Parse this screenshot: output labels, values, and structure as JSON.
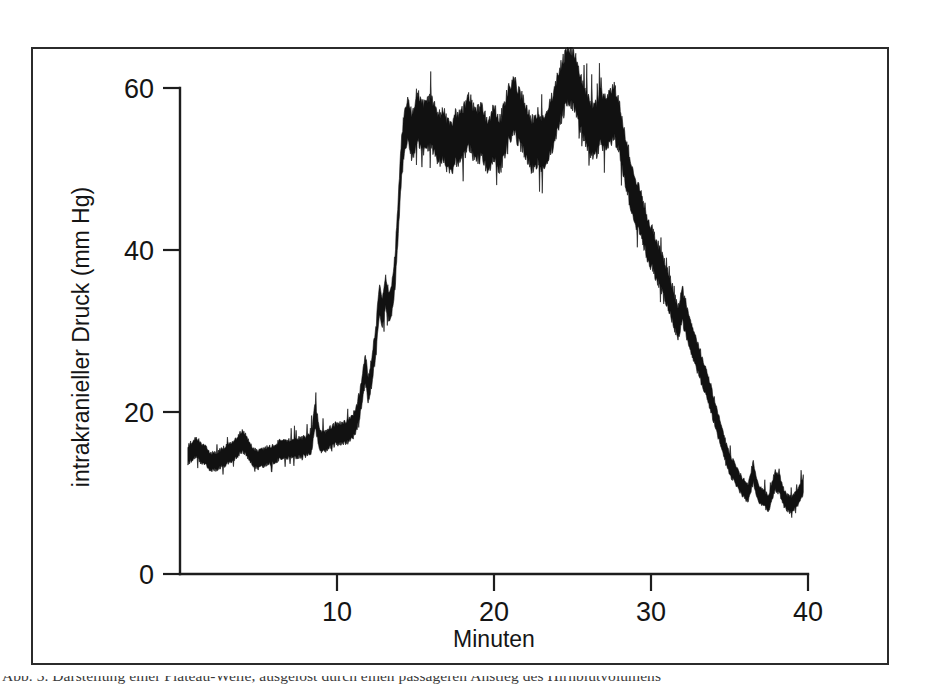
{
  "figure": {
    "background_color": "#ffffff",
    "frame_color": "#2b2b2b",
    "trace_color": "#111111",
    "caption_partial": "Abb. 3. Darstellung einer Plateau-Welle, ausgelost durch einen passageren Anstieg des Hirnblutvolumens"
  },
  "axes": {
    "x_title": "Minuten",
    "y_title": "intrakranieller Druck (mm Hg)",
    "x_ticks": [
      "10",
      "20",
      "30",
      "40"
    ],
    "y_ticks": [
      "0",
      "20",
      "40",
      "60"
    ]
  },
  "chart_data": {
    "type": "line",
    "title": "",
    "subtitle": "",
    "xlabel": "Minuten",
    "ylabel": "intrakranieller Druck (mm Hg)",
    "xlim": [
      0,
      40
    ],
    "ylim": [
      0,
      63
    ],
    "xticks": [
      10,
      20,
      30,
      40
    ],
    "yticks": [
      0,
      20,
      40,
      60
    ],
    "grid": false,
    "legend": null,
    "annotations": [],
    "series": [
      {
        "name": "intrakranieller Druck",
        "description": "Kontinuierliche ICP-Registrierung mit Plateau-Welle; dicke Spur entspricht pulsatiler Amplitude",
        "x": [
          0.5,
          1.0,
          1.5,
          2.0,
          2.5,
          3.0,
          3.5,
          4.0,
          4.3,
          4.6,
          5.0,
          5.5,
          6.0,
          6.5,
          7.0,
          7.5,
          8.0,
          8.4,
          8.6,
          8.9,
          9.3,
          9.8,
          10.3,
          10.8,
          11.2,
          11.5,
          11.8,
          12.0,
          12.2,
          12.5,
          12.7,
          12.9,
          13.1,
          13.3,
          13.5,
          13.7,
          13.9,
          14.1,
          14.3,
          14.5,
          14.8,
          15.2,
          15.6,
          16.0,
          16.4,
          16.8,
          17.2,
          17.6,
          18.0,
          18.4,
          18.8,
          19.2,
          19.6,
          20.0,
          20.4,
          20.8,
          21.2,
          21.6,
          22.0,
          22.4,
          22.8,
          23.2,
          23.6,
          24.0,
          24.4,
          24.8,
          25.2,
          25.6,
          26.0,
          26.4,
          26.8,
          27.2,
          27.6,
          28.0,
          28.3,
          28.6,
          28.9,
          29.2,
          29.5,
          29.8,
          30.1,
          30.5,
          30.9,
          31.3,
          31.7,
          32.0,
          32.3,
          32.6,
          33.0,
          33.4,
          33.8,
          34.2,
          34.6,
          35.0,
          35.4,
          35.8,
          36.2,
          36.5,
          36.8,
          37.1,
          37.5,
          37.9,
          38.2,
          38.5,
          38.9,
          39.3,
          39.7
        ],
        "y_mean": [
          14.2,
          15.0,
          14.6,
          14.0,
          14.4,
          14.8,
          15.2,
          16.4,
          15.6,
          14.8,
          14.6,
          15.0,
          14.8,
          15.2,
          15.0,
          15.4,
          15.8,
          16.4,
          19.8,
          16.2,
          16.0,
          16.6,
          17.2,
          18.0,
          19.4,
          22.0,
          26.0,
          23.0,
          25.0,
          29.0,
          34.0,
          32.0,
          35.0,
          33.0,
          34.5,
          38.0,
          45.0,
          52.0,
          55.5,
          56.5,
          54.0,
          55.5,
          53.5,
          54.5,
          53.0,
          54.0,
          52.5,
          54.0,
          53.5,
          55.0,
          53.0,
          54.5,
          53.5,
          56.0,
          54.5,
          57.0,
          58.0,
          56.0,
          54.5,
          53.0,
          54.5,
          53.5,
          55.0,
          57.0,
          58.5,
          60.0,
          59.0,
          57.5,
          56.0,
          55.0,
          56.5,
          55.0,
          56.5,
          54.5,
          52.0,
          50.0,
          47.5,
          46.5,
          44.5,
          42.0,
          40.0,
          37.5,
          35.5,
          33.5,
          31.0,
          33.5,
          31.0,
          28.5,
          26.0,
          23.5,
          21.0,
          18.5,
          16.0,
          14.0,
          12.5,
          11.0,
          10.0,
          12.5,
          10.0,
          9.5,
          9.0,
          12.0,
          11.5,
          9.5,
          8.5,
          9.0,
          10.5
        ],
        "band_halfwidth": [
          1.1,
          1.2,
          1.2,
          1.1,
          1.1,
          1.2,
          1.2,
          1.3,
          1.2,
          1.1,
          1.1,
          1.1,
          1.1,
          1.2,
          1.1,
          1.2,
          1.2,
          1.3,
          1.6,
          1.3,
          1.2,
          1.3,
          1.3,
          1.4,
          1.5,
          1.6,
          1.8,
          1.6,
          1.7,
          1.8,
          1.9,
          1.8,
          1.9,
          1.8,
          1.9,
          2.1,
          2.3,
          2.5,
          2.6,
          2.6,
          2.8,
          3.0,
          3.0,
          3.1,
          3.0,
          3.1,
          3.0,
          3.1,
          3.1,
          3.2,
          3.1,
          3.2,
          3.1,
          3.3,
          3.2,
          3.3,
          3.4,
          3.3,
          3.2,
          3.1,
          3.2,
          3.2,
          3.3,
          3.4,
          3.4,
          3.4,
          3.4,
          3.3,
          3.3,
          3.2,
          3.3,
          3.2,
          3.3,
          3.1,
          3.0,
          3.0,
          2.9,
          2.8,
          2.7,
          2.6,
          2.5,
          2.4,
          2.3,
          2.2,
          2.0,
          2.1,
          2.0,
          1.9,
          1.8,
          1.7,
          1.6,
          1.5,
          1.4,
          1.3,
          1.2,
          1.1,
          1.1,
          1.3,
          1.1,
          1.0,
          1.0,
          1.2,
          1.2,
          1.0,
          1.0,
          1.0,
          1.1
        ]
      }
    ],
    "summary": {
      "baseline_level": 15,
      "plateau_level": 55,
      "plateau_peak": 61,
      "plateau_start_min": 14.5,
      "plateau_end_min": 28.5,
      "recovery_level": 10
    }
  }
}
